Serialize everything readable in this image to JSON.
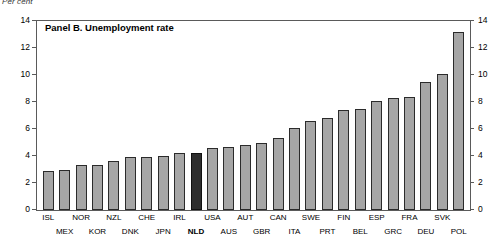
{
  "chart_data": {
    "type": "bar",
    "title": "Panel B. Unemployment rate",
    "unit_label": "Per cent",
    "xlabel": "",
    "ylabel": "",
    "ylim": [
      0,
      14
    ],
    "yticks": [
      0,
      2,
      4,
      6,
      8,
      10,
      12,
      14
    ],
    "ytick_labels": [
      "0",
      "2",
      "4",
      "6",
      "8",
      "10",
      "12",
      "14"
    ],
    "dual_axis": true,
    "grid": false,
    "legend": "none",
    "highlight_category": "NLD",
    "bar_color": "#a6a6a6",
    "highlight_color": "#2e2e2e",
    "bar_edge_color": "#2b2b2b",
    "categories": [
      "ISL",
      "MEX",
      "NOR",
      "KOR",
      "NZL",
      "DNK",
      "CHE",
      "JPN",
      "IRL",
      "NLD",
      "USA",
      "AUS",
      "AUT",
      "GBR",
      "CAN",
      "ITA",
      "SWE",
      "PRT",
      "FIN",
      "BEL",
      "ESP",
      "GRC",
      "FRA",
      "DEU",
      "SVK",
      "POL",
      "MEX2",
      "KOR2",
      "NZL2"
    ],
    "values": [
      2.9,
      3.0,
      3.3,
      3.3,
      3.6,
      3.9,
      3.9,
      4.0,
      4.2,
      4.2,
      4.6,
      4.7,
      4.8,
      5.0,
      5.3,
      6.1,
      6.6,
      6.8,
      7.4,
      7.5,
      8.1,
      8.3,
      8.4,
      9.5,
      10.1,
      13.2,
      13.8,
      7.9,
      7.0
    ]
  },
  "axis": {
    "left_ticks": [
      "14",
      "12",
      "10",
      "8",
      "6",
      "4",
      "2",
      "0"
    ],
    "right_ticks": [
      "14",
      "12",
      "10",
      "8",
      "6",
      "4",
      "2",
      "0"
    ]
  },
  "x_axis": {
    "labels": [
      {
        "text": "ISL",
        "row": 0,
        "bold": false
      },
      {
        "text": "MEX",
        "row": 1,
        "bold": false
      },
      {
        "text": "NOR",
        "row": 0,
        "bold": false
      },
      {
        "text": "KOR",
        "row": 1,
        "bold": false
      },
      {
        "text": "NZL",
        "row": 0,
        "bold": false
      },
      {
        "text": "DNK",
        "row": 1,
        "bold": false
      },
      {
        "text": "CHE",
        "row": 0,
        "bold": false
      },
      {
        "text": "JPN",
        "row": 1,
        "bold": false
      },
      {
        "text": "IRL",
        "row": 0,
        "bold": false
      },
      {
        "text": "NLD",
        "row": 1,
        "bold": true
      },
      {
        "text": "USA",
        "row": 0,
        "bold": false
      },
      {
        "text": "AUS",
        "row": 1,
        "bold": false
      },
      {
        "text": "AUT",
        "row": 0,
        "bold": false
      },
      {
        "text": "GBR",
        "row": 1,
        "bold": false
      },
      {
        "text": "CAN",
        "row": 0,
        "bold": false
      },
      {
        "text": "ITA",
        "row": 1,
        "bold": false
      },
      {
        "text": "SWE",
        "row": 0,
        "bold": false
      },
      {
        "text": "PRT",
        "row": 1,
        "bold": false
      },
      {
        "text": "FIN",
        "row": 0,
        "bold": false
      },
      {
        "text": "BEL",
        "row": 1,
        "bold": false
      },
      {
        "text": "ESP",
        "row": 0,
        "bold": false
      },
      {
        "text": "GRC",
        "row": 1,
        "bold": false
      },
      {
        "text": "FRA",
        "row": 0,
        "bold": false
      },
      {
        "text": "DEU",
        "row": 1,
        "bold": false
      },
      {
        "text": "SVK",
        "row": 0,
        "bold": false
      },
      {
        "text": "POL",
        "row": 1,
        "bold": false
      }
    ]
  }
}
